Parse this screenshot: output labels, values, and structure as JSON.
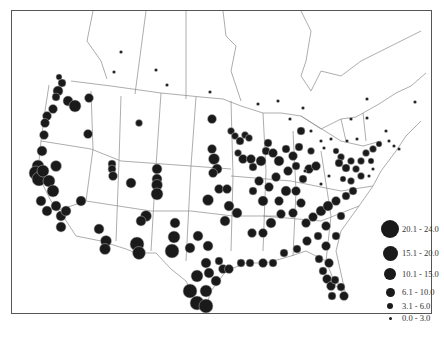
{
  "map": {
    "type": "proportional-symbol map",
    "region": "United States and southern Canada",
    "symbol_color": "#1a1a1a",
    "border_color": "#888888",
    "frame_color": "#555555"
  },
  "legend": {
    "title": "",
    "classes": [
      {
        "label": "20.1 - 24.0",
        "radius": 9
      },
      {
        "label": "15.1 - 20.0",
        "radius": 7.5
      },
      {
        "label": "10.1 - 15.0",
        "radius": 6
      },
      {
        "label": "6.1 - 10.0",
        "radius": 4.5
      },
      {
        "label": "3.1 - 6.0",
        "radius": 3.2
      },
      {
        "label": "0.0 - 3.0",
        "radius": 1.6
      }
    ]
  },
  "caption": ""
}
